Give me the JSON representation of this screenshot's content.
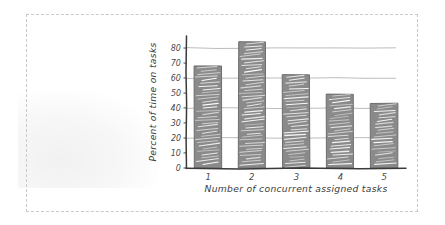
{
  "figure": {
    "border_style": "dashed",
    "border_color": "#c9c9c9",
    "background_color": "#ffffff",
    "style": "hand-drawn sketch"
  },
  "chart_data": {
    "type": "bar",
    "title": "",
    "categories": [
      "1",
      "2",
      "3",
      "4",
      "5"
    ],
    "values": [
      68,
      84,
      62,
      49,
      43
    ],
    "xlabel": "Number of concurrent assigned tasks",
    "ylabel": "Percent of time on tasks",
    "ylim": [
      0,
      88
    ],
    "ytick_labels": [
      "0",
      "10",
      "20",
      "30",
      "40",
      "50",
      "60",
      "70",
      "80"
    ],
    "ytick_values": [
      0,
      10,
      20,
      30,
      40,
      50,
      60,
      70,
      80
    ],
    "gridlines": [
      20,
      40,
      60,
      80
    ],
    "grid": true,
    "legend": null,
    "bar_color": "#8a8a8a",
    "bar_edge_color": "#6e6e6e",
    "hatch_color": "#ffffff",
    "axis_color": "#3a3a3a",
    "grid_color": "#b4b4b4"
  }
}
